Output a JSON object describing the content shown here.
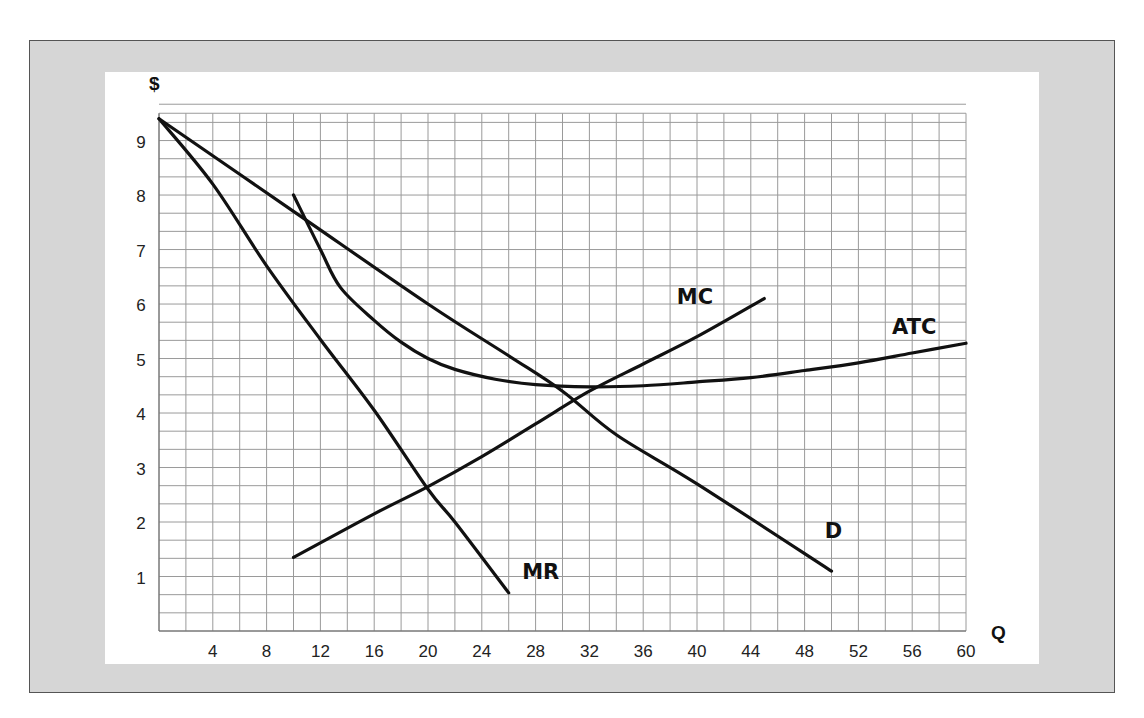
{
  "chart_data": {
    "type": "line",
    "title": "",
    "xlabel": "Q",
    "ylabel": "$",
    "xlim": [
      0,
      60
    ],
    "ylim": [
      0,
      9.5
    ],
    "grid": true,
    "x_grid_step": 2,
    "y_grid_step": 0.3333,
    "x_ticks": [
      4,
      8,
      12,
      16,
      20,
      24,
      28,
      32,
      36,
      40,
      44,
      48,
      52,
      56,
      60
    ],
    "y_ticks": [
      1,
      2,
      3,
      4,
      5,
      6,
      7,
      8,
      9
    ],
    "legend": "none (curves labeled inline)",
    "series": [
      {
        "name": "D",
        "label_pos": [
          49.5,
          1.7
        ],
        "points": [
          [
            0,
            9.4
          ],
          [
            10,
            7.7
          ],
          [
            20,
            6.0
          ],
          [
            26,
            5.05
          ],
          [
            30,
            4.4
          ],
          [
            34,
            3.6
          ],
          [
            40,
            2.7
          ],
          [
            50,
            1.1
          ]
        ]
      },
      {
        "name": "MR",
        "label_pos": [
          27,
          0.95
        ],
        "points": [
          [
            0,
            9.4
          ],
          [
            4,
            8.2
          ],
          [
            8,
            6.7
          ],
          [
            12,
            5.35
          ],
          [
            16,
            4.05
          ],
          [
            20,
            2.6
          ],
          [
            22,
            2.0
          ],
          [
            26,
            0.7
          ]
        ]
      },
      {
        "name": "MC",
        "label_pos": [
          38.5,
          6.0
        ],
        "points": [
          [
            10,
            1.35
          ],
          [
            16,
            2.15
          ],
          [
            20,
            2.65
          ],
          [
            24,
            3.2
          ],
          [
            28,
            3.8
          ],
          [
            32,
            4.4
          ],
          [
            36,
            4.9
          ],
          [
            40,
            5.4
          ],
          [
            45,
            6.1
          ]
        ]
      },
      {
        "name": "ATC",
        "label_pos": [
          54.5,
          5.45
        ],
        "points": [
          [
            10,
            8.0
          ],
          [
            12,
            7.0
          ],
          [
            13.5,
            6.3
          ],
          [
            16,
            5.7
          ],
          [
            18,
            5.3
          ],
          [
            20,
            5.0
          ],
          [
            22,
            4.8
          ],
          [
            25,
            4.62
          ],
          [
            28,
            4.52
          ],
          [
            32,
            4.48
          ],
          [
            36,
            4.5
          ],
          [
            40,
            4.57
          ],
          [
            44,
            4.65
          ],
          [
            48,
            4.78
          ],
          [
            52,
            4.92
          ],
          [
            56,
            5.1
          ],
          [
            60,
            5.28
          ]
        ]
      }
    ]
  }
}
